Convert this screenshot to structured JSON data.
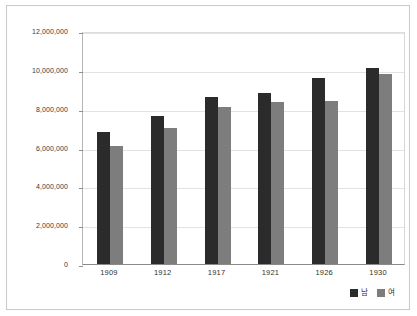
{
  "chart_data": {
    "type": "bar",
    "title": "",
    "xlabel": "",
    "ylabel": "",
    "categories": [
      "1909",
      "1912",
      "1917",
      "1921",
      "1926",
      "1930"
    ],
    "series": [
      {
        "name": "남",
        "color": "#2b2b2b",
        "values": [
          6820000,
          7600000,
          8620000,
          8800000,
          9600000,
          10100000
        ]
      },
      {
        "name": "여",
        "color": "#7d7d7d",
        "values": [
          6100000,
          6980000,
          8100000,
          8340000,
          8380000,
          9780000
        ]
      }
    ],
    "ylim": [
      0,
      12000000
    ],
    "ytick_values": [
      0,
      2000000,
      4000000,
      6000000,
      8000000,
      10000000,
      12000000
    ],
    "ytick_labels": [
      "0",
      "2,000,000",
      "4,000,000",
      "6,000,000",
      "8,000,000",
      "10,000,000",
      "12,000,000"
    ],
    "grid": true,
    "legend_position": "bottom-right",
    "frame": true
  },
  "legend": {
    "items": [
      {
        "label": "남",
        "color": "#2b2b2b"
      },
      {
        "label": "여",
        "color": "#7d7d7d"
      }
    ]
  }
}
